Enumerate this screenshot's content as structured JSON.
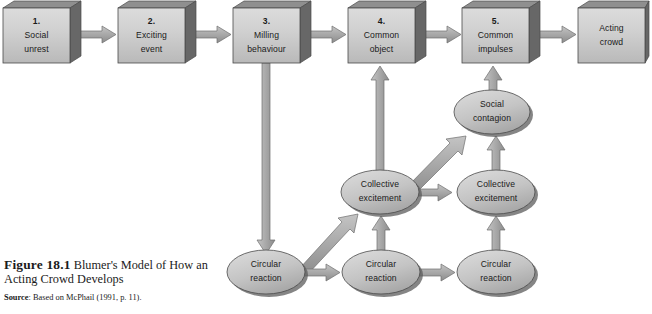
{
  "figure": {
    "caption_label": "Figure 18.1",
    "caption_text": " Blumer's Model of How an Acting Crowd Develops",
    "source_label": "Source",
    "source_text": ": Based on McPhail (1991, p. 11)."
  },
  "colors": {
    "box_fill_light": "#d5d5d5",
    "box_fill_dark": "#b4b4b4",
    "box_side": "#6e6e6e",
    "box_bottom": "#4f4f4f",
    "ellipse_fill_light": "#cfcfcf",
    "ellipse_fill_dark": "#a8a8a8",
    "ellipse_shadow": "#5c5c5c",
    "arrow_fill": "#a6a6a6",
    "arrow_stroke": "#6f6f6f",
    "outline": "#4a4a4a",
    "text": "#1a1a1a",
    "background": "#ffffff"
  },
  "diagram": {
    "type": "flow-diagram",
    "stages": [
      {
        "id": "stage-1",
        "number": "1.",
        "line1": "Social",
        "line2": "unrest",
        "shape": "box",
        "x": 3,
        "y": 8,
        "w": 67,
        "h": 55
      },
      {
        "id": "stage-2",
        "number": "2.",
        "line1": "Exciting",
        "line2": "event",
        "shape": "box",
        "x": 118,
        "y": 8,
        "w": 67,
        "h": 55
      },
      {
        "id": "stage-3",
        "number": "3.",
        "line1": "Milling",
        "line2": "behaviour",
        "shape": "box",
        "x": 233,
        "y": 8,
        "w": 67,
        "h": 55
      },
      {
        "id": "stage-4",
        "number": "4.",
        "line1": "Common",
        "line2": "object",
        "shape": "box",
        "x": 348,
        "y": 8,
        "w": 67,
        "h": 55
      },
      {
        "id": "stage-5",
        "number": "5.",
        "line1": "Common",
        "line2": "impulses",
        "shape": "box",
        "x": 462,
        "y": 8,
        "w": 67,
        "h": 55
      },
      {
        "id": "stage-outcome",
        "number": "",
        "line1": "Acting",
        "line2": "crowd",
        "shape": "box",
        "x": 578,
        "y": 8,
        "w": 67,
        "h": 55
      }
    ],
    "processes": [
      {
        "id": "social-contagion",
        "line1": "Social",
        "line2": "contagion",
        "shape": "ellipse",
        "cx": 492,
        "cy": 112,
        "rx": 38,
        "ry": 22
      },
      {
        "id": "collective-excitement-1",
        "line1": "Collective",
        "line2": "excitement",
        "shape": "ellipse",
        "cx": 380,
        "cy": 192,
        "rx": 39,
        "ry": 22
      },
      {
        "id": "collective-excitement-2",
        "line1": "Collective",
        "line2": "excitement",
        "shape": "ellipse",
        "cx": 496,
        "cy": 192,
        "rx": 39,
        "ry": 22
      },
      {
        "id": "circular-reaction-1",
        "line1": "Circular",
        "line2": "reaction",
        "shape": "ellipse",
        "cx": 266,
        "cy": 272,
        "rx": 39,
        "ry": 22
      },
      {
        "id": "circular-reaction-2",
        "line1": "Circular",
        "line2": "reaction",
        "shape": "ellipse",
        "cx": 381,
        "cy": 272,
        "rx": 39,
        "ry": 22
      },
      {
        "id": "circular-reaction-3",
        "line1": "Circular",
        "line2": "reaction",
        "shape": "ellipse",
        "cx": 496,
        "cy": 272,
        "rx": 39,
        "ry": 22
      }
    ],
    "connections": [
      {
        "id": "arrow-1-to-2",
        "from": "stage-1",
        "to": "stage-2",
        "direction": "right"
      },
      {
        "id": "arrow-2-to-3",
        "from": "stage-2",
        "to": "stage-3",
        "direction": "right"
      },
      {
        "id": "arrow-3-to-4",
        "from": "stage-3",
        "to": "stage-4",
        "direction": "right"
      },
      {
        "id": "arrow-4-to-5",
        "from": "stage-4",
        "to": "stage-5",
        "direction": "right"
      },
      {
        "id": "arrow-5-to-outcome",
        "from": "stage-5",
        "to": "stage-outcome",
        "direction": "right"
      },
      {
        "id": "arrow-milling-to-circular1",
        "from": "stage-3",
        "to": "circular-reaction-1",
        "direction": "down"
      },
      {
        "id": "arrow-circular1-to-circular2",
        "from": "circular-reaction-1",
        "to": "circular-reaction-2",
        "direction": "right"
      },
      {
        "id": "arrow-circular2-to-circular3",
        "from": "circular-reaction-2",
        "to": "circular-reaction-3",
        "direction": "right"
      },
      {
        "id": "arrow-circular1-to-collective1",
        "from": "circular-reaction-1",
        "to": "collective-excitement-1",
        "direction": "diagonal-up-right"
      },
      {
        "id": "arrow-circular2-to-collective1",
        "from": "circular-reaction-2",
        "to": "collective-excitement-1",
        "direction": "up"
      },
      {
        "id": "arrow-circular3-to-collective2",
        "from": "circular-reaction-3",
        "to": "collective-excitement-2",
        "direction": "up"
      },
      {
        "id": "arrow-collective1-to-collective2",
        "from": "collective-excitement-1",
        "to": "collective-excitement-2",
        "direction": "right"
      },
      {
        "id": "arrow-collective1-to-common-object",
        "from": "collective-excitement-1",
        "to": "stage-4",
        "direction": "up"
      },
      {
        "id": "arrow-collective1-to-social-contagion",
        "from": "collective-excitement-1",
        "to": "social-contagion",
        "direction": "diagonal-up-right"
      },
      {
        "id": "arrow-collective2-to-social-contagion",
        "from": "collective-excitement-2",
        "to": "social-contagion",
        "direction": "up"
      },
      {
        "id": "arrow-social-contagion-to-impulses",
        "from": "social-contagion",
        "to": "stage-5",
        "direction": "up"
      }
    ]
  }
}
